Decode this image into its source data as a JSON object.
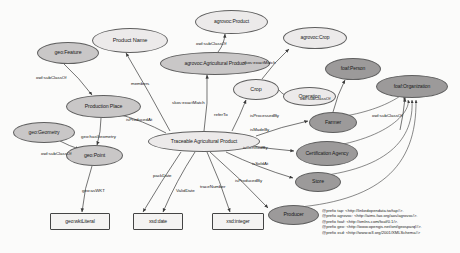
{
  "diagram": {
    "colors": {
      "light_fill": "#eceaea",
      "mid_fill": "#c9c7c7",
      "dark_fill": "#9c9a9a",
      "stroke": "#5f5f5f",
      "text": "#1a1a1a",
      "background": "#fbfbfa"
    },
    "nodes": [
      {
        "id": "agrovoc_product",
        "label": "agrovoc:Product",
        "shape": "ellipse",
        "fill": "light",
        "x": 195,
        "y": 10,
        "w": 73,
        "h": 24,
        "fs": 5.0
      },
      {
        "id": "product_name",
        "label": "Product Name",
        "shape": "ellipse",
        "fill": "light",
        "x": 92,
        "y": 28,
        "w": 76,
        "h": 25,
        "fs": 5.6
      },
      {
        "id": "geo_feature",
        "label": "geo:Feature",
        "shape": "ellipse",
        "fill": "mid",
        "x": 37,
        "y": 42,
        "w": 62,
        "h": 22,
        "fs": 5.2
      },
      {
        "id": "agrovoc_agri",
        "label": "agrovoc:Agricultural Product",
        "shape": "ellipse",
        "fill": "mid",
        "x": 160,
        "y": 52,
        "w": 110,
        "h": 23,
        "fs": 5.1
      },
      {
        "id": "agrovoc_crop",
        "label": "agrovoc:Crop",
        "shape": "ellipse",
        "fill": "light",
        "x": 283,
        "y": 27,
        "w": 64,
        "h": 22,
        "fs": 5.0
      },
      {
        "id": "foaf_person",
        "label": "foaf:Person",
        "shape": "ellipse",
        "fill": "dark",
        "x": 325,
        "y": 58,
        "w": 56,
        "h": 22,
        "fs": 5.0
      },
      {
        "id": "foaf_organization",
        "label": "foaf:Organization",
        "shape": "ellipse",
        "fill": "dark",
        "x": 376,
        "y": 75,
        "w": 72,
        "h": 23,
        "fs": 5.0
      },
      {
        "id": "crop",
        "label": "Crop",
        "shape": "ellipse",
        "fill": "light",
        "x": 233,
        "y": 79,
        "w": 46,
        "h": 21,
        "fs": 5.4
      },
      {
        "id": "operation",
        "label": "Operation",
        "shape": "ellipse",
        "fill": "light",
        "x": 283,
        "y": 87,
        "w": 53,
        "h": 19,
        "fs": 5.2
      },
      {
        "id": "production_place",
        "label": "Production Place",
        "shape": "ellipse",
        "fill": "mid",
        "x": 66,
        "y": 95,
        "w": 75,
        "h": 23,
        "fs": 5.2
      },
      {
        "id": "farmer",
        "label": "Farmer",
        "shape": "ellipse",
        "fill": "dark",
        "x": 309,
        "y": 112,
        "w": 48,
        "h": 21,
        "fs": 5.2
      },
      {
        "id": "geo_geometry",
        "label": "geo:Geometry",
        "shape": "ellipse",
        "fill": "mid",
        "x": 13,
        "y": 122,
        "w": 62,
        "h": 21,
        "fs": 5.1
      },
      {
        "id": "traceable_product",
        "label": "Traceable Agricultural Product",
        "shape": "ellipse",
        "fill": "light",
        "x": 148,
        "y": 131,
        "w": 112,
        "h": 21,
        "fs": 5.2
      },
      {
        "id": "certification",
        "label": "Certification Agency",
        "shape": "ellipse",
        "fill": "dark",
        "x": 296,
        "y": 141,
        "w": 62,
        "h": 25,
        "fs": 5.1
      },
      {
        "id": "geo_point",
        "label": "geo:Point",
        "shape": "ellipse",
        "fill": "mid",
        "x": 66,
        "y": 145,
        "w": 57,
        "h": 21,
        "fs": 5.2
      },
      {
        "id": "store",
        "label": "Store",
        "shape": "ellipse",
        "fill": "dark",
        "x": 295,
        "y": 172,
        "w": 46,
        "h": 20,
        "fs": 5.2
      },
      {
        "id": "producer",
        "label": "Producer",
        "shape": "ellipse",
        "fill": "dark",
        "x": 268,
        "y": 205,
        "w": 51,
        "h": 20,
        "fs": 5.2
      },
      {
        "id": "geo_wktliteral",
        "label": "geo:wktLiteral",
        "shape": "rect",
        "fill": "rect",
        "x": 50,
        "y": 213,
        "w": 60,
        "h": 17,
        "fs": 5.0
      },
      {
        "id": "xsd_date",
        "label": "xsd:date",
        "shape": "rect",
        "fill": "rect",
        "x": 133,
        "y": 213,
        "w": 50,
        "h": 17,
        "fs": 5.0
      },
      {
        "id": "xsd_integer",
        "label": "xsd:integer",
        "shape": "rect",
        "fill": "rect",
        "x": 212,
        "y": 213,
        "w": 52,
        "h": 17,
        "fs": 5.0
      }
    ],
    "edges": [
      {
        "id": "e1",
        "label": "owl:subClassOf",
        "from": "agrovoc_agri",
        "to": "agrovoc_product",
        "x1": 218,
        "y1": 52,
        "x2": 225,
        "y2": 34,
        "lx": 196,
        "ly": 41
      },
      {
        "id": "e2",
        "label": "owl:subClassOf",
        "from": "geo_feature",
        "to": "production_place",
        "x1": 64,
        "y1": 64,
        "x2": 92,
        "y2": 95,
        "lx": 36,
        "ly": 75
      },
      {
        "id": "e3",
        "label": "members",
        "from": "traceable_product",
        "to": "product_name",
        "x1": 170,
        "y1": 131,
        "x2": 126,
        "y2": 53,
        "lx": 131,
        "ly": 81
      },
      {
        "id": "e4",
        "label": "skos:exactMatch",
        "from": "traceable_product",
        "to": "agrovoc_agri",
        "x1": 204,
        "y1": 131,
        "x2": 207,
        "y2": 75,
        "lx": 172,
        "ly": 100
      },
      {
        "id": "e5",
        "label": "skos:exactMatch",
        "from": "crop",
        "to": "agrovoc_crop",
        "x1": 262,
        "y1": 79,
        "x2": 289,
        "y2": 49,
        "lx": 243,
        "ly": 60
      },
      {
        "id": "e6",
        "label": "referTo",
        "from": "traceable_product",
        "to": "crop",
        "x1": 232,
        "y1": 131,
        "x2": 246,
        "y2": 100,
        "lx": 214,
        "ly": 112
      },
      {
        "id": "e7",
        "label": "isProcessedBy",
        "from": "crop",
        "to": "operation",
        "x1": 279,
        "y1": 90,
        "x2": 290,
        "y2": 96,
        "lx": 250,
        "ly": 113
      },
      {
        "id": "e8",
        "label": "owl:subClassOf",
        "from": "farmer",
        "to": "foaf_person",
        "x1": 333,
        "y1": 112,
        "x2": 345,
        "y2": 80,
        "lx": 300,
        "ly": 96
      },
      {
        "id": "e9",
        "label": "owl:subClassOf",
        "from": "certification",
        "to": "foaf_organization",
        "x1": 400,
        "y1": 130,
        "x2": 405,
        "y2": 98,
        "lx": 372,
        "ly": 113
      },
      {
        "id": "e10",
        "label": "isProducedAt",
        "from": "traceable_product",
        "to": "production_place",
        "x1": 166,
        "y1": 133,
        "x2": 118,
        "y2": 114,
        "lx": 126,
        "ly": 117
      },
      {
        "id": "e11",
        "label": "geo:hasGeometry",
        "from": "production_place",
        "to": "geo_point",
        "x1": 101,
        "y1": 118,
        "x2": 97,
        "y2": 145,
        "lx": 81,
        "ly": 134
      },
      {
        "id": "e12",
        "label": "owl:subClassOf",
        "from": "geo_geometry",
        "to": "geo_point",
        "x1": 60,
        "y1": 141,
        "x2": 79,
        "y2": 149,
        "lx": 41,
        "ly": 151
      },
      {
        "id": "e13",
        "label": "geo:asWKT",
        "from": "geo_point",
        "to": "geo_wktliteral",
        "x1": 92,
        "y1": 166,
        "x2": 82,
        "y2": 212,
        "lx": 82,
        "ly": 188
      },
      {
        "id": "e14",
        "label": "isMadeBy",
        "from": "traceable_product",
        "to": "farmer",
        "x1": 256,
        "y1": 136,
        "x2": 308,
        "y2": 121,
        "lx": 250,
        "ly": 127
      },
      {
        "id": "e15",
        "label": "isCertifiedBy",
        "from": "traceable_product",
        "to": "certification",
        "x1": 246,
        "y1": 145,
        "x2": 294,
        "y2": 151,
        "lx": 243,
        "ly": 145
      },
      {
        "id": "e16",
        "label": "isSoldAt",
        "from": "traceable_product",
        "to": "store",
        "x1": 226,
        "y1": 152,
        "x2": 293,
        "y2": 178,
        "lx": 252,
        "ly": 161
      },
      {
        "id": "e17",
        "label": "isProducedBy",
        "from": "traceable_product",
        "to": "producer",
        "x1": 210,
        "y1": 152,
        "x2": 268,
        "y2": 208,
        "lx": 235,
        "ly": 178
      },
      {
        "id": "e18",
        "label": "packDate",
        "from": "traceable_product",
        "to": "xsd_date",
        "x1": 181,
        "y1": 152,
        "x2": 143,
        "y2": 212,
        "lx": 153,
        "ly": 173
      },
      {
        "id": "e19",
        "label": "ValidDate",
        "from": "traceable_product",
        "to": "xsd_date",
        "x1": 195,
        "y1": 152,
        "x2": 163,
        "y2": 212,
        "lx": 176,
        "ly": 188
      },
      {
        "id": "e20",
        "label": "traceNumber",
        "from": "traceable_product",
        "to": "xsd_integer",
        "x1": 207,
        "y1": 152,
        "x2": 230,
        "y2": 212,
        "lx": 200,
        "ly": 184
      }
    ],
    "legend": {
      "lines": [
        "@prefix tap:  <http://linkedopendata.tw/tap#>.",
        "@prefix agrovoc:  <http://aims.fao.org/aos/agrovoc/>.",
        "@prefix foaf:  <http://xmlns.com/foaf/0.1/>.",
        "@prefix geo:  <http://www.opengis.net/ont/geosparql#>.",
        "@prefix xsd:  <http://www.w3.org/2001/XMLSchema#>"
      ]
    }
  }
}
